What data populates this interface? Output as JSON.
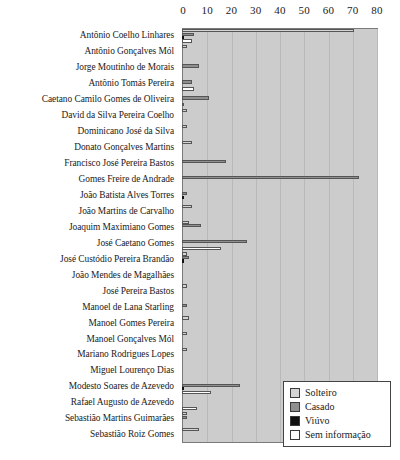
{
  "chart_data": {
    "type": "bar",
    "orientation": "horizontal",
    "title": "",
    "xlabel": "",
    "ylabel": "",
    "xlim": [
      0,
      80
    ],
    "xticks": [
      0,
      10,
      20,
      30,
      40,
      50,
      60,
      70,
      80
    ],
    "grid": true,
    "legend_position": "bottom-right",
    "categories": [
      "Antônio Coelho Linhares",
      "Antônio Gonçalves Mól",
      "Jorge Moutinho de Morais",
      "Antônio Tomás Pereira",
      "Caetano Camilo Gomes de Oliveira",
      "David da Silva Pereira Coelho",
      "Dominicano José da Silva",
      "Donato Gonçalves Martins",
      "Francisco José Pereira Bastos",
      "Gomes Freire de Andrade",
      "João Batista Alves Torres",
      "João Martins de Carvalho",
      "Joaquim Maximiano Gomes",
      "José Caetano Gomes",
      "José Custódio Pereira Brandão",
      "João Mendes de Magalhães",
      "José Pereira Bastos",
      "Manoel de Lana Starling",
      "Manoel Gomes Pereira",
      "Manoel Gonçalves Mól",
      "Mariano Rodrigues Lopes",
      "Miguel Lourenço Dias",
      "Modesto Soares de Azevedo",
      "Rafael Augusto de Azevedo",
      "Sebastião Martins Guimarães",
      "Sebastião Roiz Gomes"
    ],
    "series": [
      {
        "name": "Solteiro",
        "color": "#d4d4d4",
        "values": [
          71,
          2,
          0,
          0,
          0,
          2,
          2,
          4,
          0,
          0,
          0,
          4,
          3,
          0,
          2,
          0,
          2,
          0,
          3,
          2,
          2,
          0,
          0,
          0,
          2,
          7
        ]
      },
      {
        "name": "Casado",
        "color": "#8f8f8f",
        "values": [
          5,
          0,
          7,
          4,
          11,
          0,
          0,
          0,
          18,
          73,
          2,
          0,
          8,
          27,
          3,
          0,
          0,
          2,
          0,
          0,
          0,
          0,
          24,
          0,
          2,
          0
        ]
      },
      {
        "name": "Viúvo",
        "color": "#111111",
        "values": [
          1,
          0,
          0,
          0,
          0,
          0,
          0,
          0,
          0,
          0,
          1,
          0,
          0,
          0,
          1,
          0,
          0,
          0,
          0,
          0,
          0,
          0,
          1,
          0,
          0,
          0
        ]
      },
      {
        "name": "Sem informação",
        "color": "#ffffff",
        "values": [
          4,
          0,
          0,
          5,
          1,
          0,
          0,
          0,
          0,
          0,
          0,
          0,
          0,
          16,
          0,
          0,
          0,
          0,
          0,
          0,
          0,
          0,
          12,
          6,
          0,
          0
        ]
      }
    ]
  },
  "legend": {
    "items": [
      {
        "label": "Solteiro",
        "swatch": "solteiro"
      },
      {
        "label": "Casado",
        "swatch": "casado"
      },
      {
        "label": "Viúvo",
        "swatch": "viuvo"
      },
      {
        "label": "Sem informação",
        "swatch": "sem"
      }
    ]
  }
}
